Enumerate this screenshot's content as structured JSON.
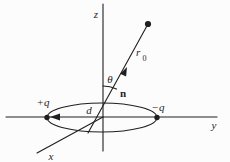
{
  "diagram": {
    "axes": {
      "z_label": "z",
      "y_label": "y",
      "x_label": "x"
    },
    "charges": {
      "positive_label": "+q",
      "negative_label": "−q"
    },
    "separation_label": "d",
    "angle_label": "θ",
    "direction_vector_label": "n",
    "distance_label": {
      "base": "r",
      "subscript": "0"
    },
    "colors": {
      "stroke": "#1f1f1f",
      "background": "#fcfcfc"
    }
  }
}
